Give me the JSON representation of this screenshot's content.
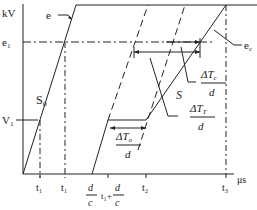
{
  "diagram": {
    "axes": {
      "y_label": "kV",
      "x_label": "μs",
      "y_ticks": [
        "e₁",
        "V₁"
      ],
      "x_ticks": [
        "t₁",
        "t₁",
        "d",
        "c",
        "t₁+",
        "d",
        "c",
        "t₂",
        "t₃"
      ]
    },
    "labels": {
      "e": "e",
      "e1": "e₁",
      "ec": "e",
      "ec_sub": "c",
      "S0": "S",
      "S0_sub": "o",
      "S": "S",
      "V1": "V₁",
      "dTc_num": "ΔT",
      "dTc_sub": "c",
      "dTc_den": "d",
      "dTT_num": "ΔT",
      "dTT_sub": "T",
      "dTT_den": "d",
      "dTo_num": "ΔT",
      "dTo_sub": "o",
      "dTo_den": "d",
      "t1a": "t₁",
      "t1b": "t₁",
      "dc_num": "d",
      "dc_den": "c",
      "t1dc_pre": "t₁+",
      "t1dc_num": "d",
      "t1dc_den": "c",
      "t2": "t₂",
      "t3": "t₃",
      "kV": "kV",
      "us": "μs"
    },
    "colors": {
      "line": "#222222",
      "background": "#ffffff"
    }
  }
}
